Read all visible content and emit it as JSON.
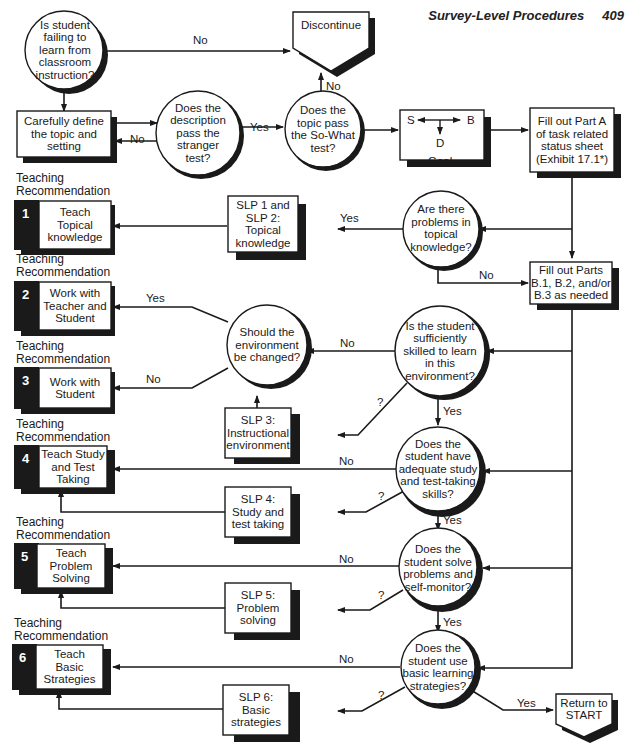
{
  "header": {
    "title": "Survey-Level Procedures",
    "page_number": "409"
  },
  "colors": {
    "ink": "#1a1a1a",
    "shadow": "#1a1a1a",
    "paper": "#ffffff"
  },
  "nodes": {
    "start_q": "Is student\nfailing to\nlearn from\nclassroom\ninstruction?",
    "discontinue": "Discontinue",
    "define_topic": "Carefully define\nthe topic and\nsetting",
    "stranger_test": "Does the\ndescription\npass the\nstranger\ntest?",
    "so_what_test": "Does the\ntopic pass\nthe So-What\ntest?",
    "goal": {
      "s": "S",
      "b": "B",
      "d": "D",
      "label": "Goal"
    },
    "part_a": "Fill out Part A\nof task related\nstatus sheet\n(Exhibit 17.1*)",
    "topical_q": "Are there\nproblems in\ntopical\nknowledge?",
    "slp12": "SLP 1 and\nSLP 2:\nTopical\nknowledge",
    "parts_b": "Fill out Parts\nB.1, B.2, and/or\nB.3 as needed",
    "skilled_q": "Is the student\nsufficiently\nskilled to learn\nin this\nenvironment?",
    "env_q": "Should the\nenvironment\nbe changed?",
    "slp3": "SLP 3:\nInstructional\nenvironment",
    "study_q": "Does the\nstudent have\nadequate study\nand test-taking\nskills?",
    "slp4": "SLP 4:\nStudy and\ntest taking",
    "solve_q": "Does the\nstudent solve\nproblems and\nself-monitor?",
    "slp5": "SLP 5:\nProblem\nsolving",
    "strategies_q": "Does the\nstudent use\nbasic learning\nstrategies?",
    "slp6": "SLP 6:\nBasic\nstrategies",
    "return_start": "Return to\nSTART"
  },
  "recommendations": [
    {
      "heading": "Teaching\nRecommendation",
      "number": "1",
      "text": "Teach\nTopical\nknowledge"
    },
    {
      "heading": "Teaching\nRecommendation",
      "number": "2",
      "text": "Work with\nTeacher and\nStudent"
    },
    {
      "heading": "Teaching\nRecommendation",
      "number": "3",
      "text": "Work with\nStudent"
    },
    {
      "heading": "Teaching\nRecommendation",
      "number": "4",
      "text": "Teach Study\nand Test\nTaking"
    },
    {
      "heading": "Teaching\nRecommendation",
      "number": "5",
      "text": "Teach\nProblem\nSolving"
    },
    {
      "heading": "Teaching\nRecommendation",
      "number": "6",
      "text": "Teach\nBasic\nStrategies"
    }
  ],
  "edge_labels": {
    "start_no": "No",
    "so_what_no": "No",
    "stranger_yes": "Yes",
    "stranger_no": "No",
    "topical_yes": "Yes",
    "topical_no": "No",
    "env_yes": "Yes",
    "env_no": "No",
    "skilled_no": "No",
    "skilled_maybe": "?",
    "skilled_yes": "Yes",
    "study_no": "No",
    "study_maybe": "?",
    "study_yes": "Yes",
    "solve_no": "No",
    "solve_maybe": "?",
    "solve_yes": "Yes",
    "strategies_no": "No",
    "strategies_maybe": "?",
    "strategies_yes": "Yes"
  }
}
